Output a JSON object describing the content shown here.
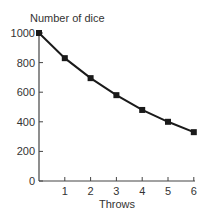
{
  "chart_data": {
    "type": "line",
    "title": "",
    "ylabel": "Number of dice",
    "xlabel": "Throws",
    "x": [
      0,
      1,
      2,
      3,
      4,
      5,
      6
    ],
    "series": [
      {
        "name": "Number of dice",
        "values": [
          1000,
          830,
          695,
          580,
          480,
          400,
          330
        ]
      }
    ],
    "xticks": [
      "1",
      "2",
      "3",
      "4",
      "5",
      "6"
    ],
    "yticks": [
      "0",
      "200",
      "400",
      "600",
      "800",
      "1000"
    ],
    "xlim": [
      0,
      6
    ],
    "ylim": [
      0,
      1000
    ],
    "grid": false,
    "legend": null,
    "marker": "square",
    "line_color": "#1a1a1a"
  }
}
